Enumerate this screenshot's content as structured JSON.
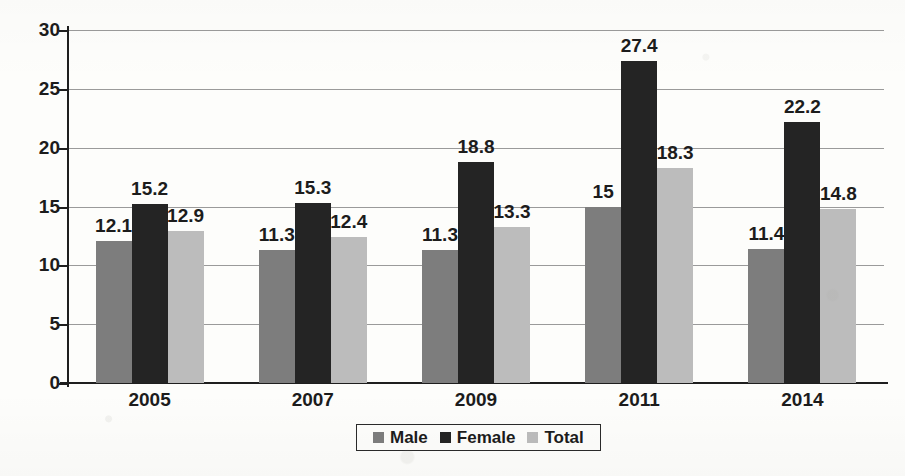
{
  "chart_data": {
    "type": "bar",
    "title": "",
    "subtitle": "",
    "xlabel": "",
    "ylabel": "Uemployment rate",
    "categories": [
      "2005",
      "2007",
      "2009",
      "2011",
      "2014"
    ],
    "series": [
      {
        "name": "Male",
        "color": "#7d7d7d",
        "values": [
          12.1,
          11.3,
          11.3,
          15,
          11.4
        ],
        "labels": [
          "12.1",
          "11.3",
          "11.3",
          "15",
          "11.4"
        ]
      },
      {
        "name": "Female",
        "color": "#242424",
        "values": [
          15.2,
          15.3,
          18.8,
          27.4,
          22.2
        ],
        "labels": [
          "15.2",
          "15.3",
          "18.8",
          "27.4",
          "22.2"
        ]
      },
      {
        "name": "Total",
        "color": "#bcbcbc",
        "values": [
          12.9,
          12.4,
          13.3,
          18.3,
          14.8
        ],
        "labels": [
          "12.9",
          "12.4",
          "13.3",
          "18.3",
          "14.8"
        ]
      }
    ],
    "ylim": [
      0,
      30
    ],
    "ytick_labels": [
      "0",
      "5",
      "10",
      "15",
      "20",
      "25",
      "30"
    ],
    "ytick_values": [
      0,
      5,
      10,
      15,
      20,
      25,
      30
    ],
    "grid": true,
    "grid_axis": "y",
    "legend_position": "bottom-center",
    "data_labels": true,
    "background_color": "#fdfdfb",
    "text_color": "#1c1c1c"
  },
  "legend": {
    "entries": [
      {
        "label": "Male",
        "color": "#7d7d7d"
      },
      {
        "label": "Female",
        "color": "#242424"
      },
      {
        "label": "Total",
        "color": "#bcbcbc"
      }
    ]
  }
}
